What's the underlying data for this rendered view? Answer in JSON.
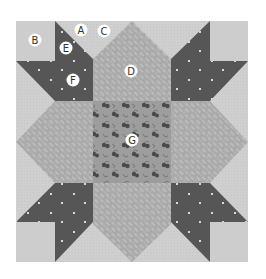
{
  "figure": {
    "type": "quilt-block-diagram",
    "colors": {
      "background": "#ffffff",
      "light": "#cfcfcf",
      "dark": "#565656",
      "dark_dot": "#d8d8d8",
      "arm_pattern": "#a9a9a9",
      "arm_dash": "#d2d2d2",
      "center": "#9d9d9d",
      "cherry": "#4a4a4a",
      "label_bg": "#ffffff",
      "label_text": "#333333"
    },
    "labels": [
      {
        "id": "B",
        "text": "B",
        "x": 35,
        "y": 40,
        "piece": "corner-square"
      },
      {
        "id": "A",
        "text": "A",
        "x": 81,
        "y": 30,
        "piece": "light-triangle"
      },
      {
        "id": "C",
        "text": "C",
        "x": 104,
        "y": 31,
        "piece": "light-triangle"
      },
      {
        "id": "E",
        "text": "E",
        "x": 66,
        "y": 48,
        "piece": "dark-star-point"
      },
      {
        "id": "F",
        "text": "F",
        "x": 73,
        "y": 80,
        "piece": "dark-star-body"
      },
      {
        "id": "D",
        "text": "D",
        "x": 131,
        "y": 71,
        "piece": "patterned-arm"
      },
      {
        "id": "G",
        "text": "G",
        "x": 132,
        "y": 140,
        "piece": "center-square"
      }
    ]
  }
}
